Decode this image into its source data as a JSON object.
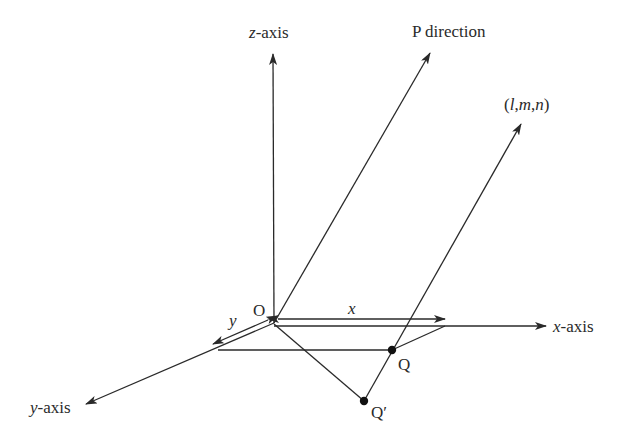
{
  "diagram": {
    "type": "3d-coordinate-direction",
    "labels": {
      "z_axis": {
        "var": "z",
        "suffix": "-axis"
      },
      "x_axis": {
        "var": "x",
        "suffix": "-axis"
      },
      "y_axis": {
        "var": "y",
        "suffix": "-axis"
      },
      "p_direction": "P direction",
      "direction_cosines": {
        "open": "(",
        "l": "l",
        "c1": ",",
        "m": "m",
        "c2": ",",
        "n": "n",
        "close": ")"
      },
      "origin": "O",
      "x_length": "x",
      "y_length": "y",
      "point_q": "Q",
      "point_q_prime": "Q′"
    },
    "colors": {
      "ink": "#2a2a2a",
      "background": "#ffffff"
    }
  }
}
